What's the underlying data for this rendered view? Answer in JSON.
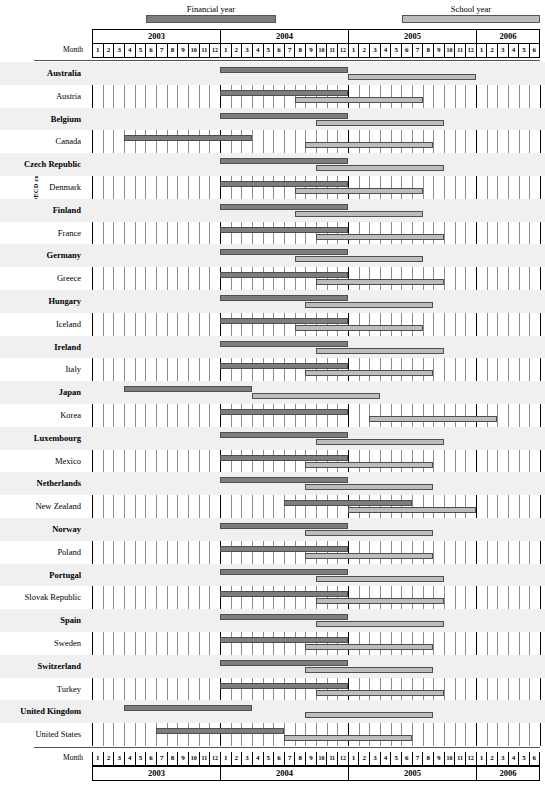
{
  "legend": {
    "financial": {
      "label": "Financial year",
      "color": "#7d7d7d"
    },
    "school": {
      "label": "School year",
      "color": "#bdbdbd"
    }
  },
  "axis": {
    "y_label": "OECD countries",
    "month_label_top": "Month",
    "month_label_bottom": "Month"
  },
  "chart_data": {
    "type": "bar",
    "title": "",
    "xlabel": "Month",
    "ylabel": "OECD countries",
    "orientation": "horizontal-gantt",
    "grid": true,
    "legend_position": "top",
    "x_axis": {
      "years": [
        {
          "year": "2003",
          "months": [
            "1",
            "2",
            "3",
            "4",
            "5",
            "6",
            "7",
            "8",
            "9",
            "10",
            "11",
            "12"
          ]
        },
        {
          "year": "2004",
          "months": [
            "1",
            "2",
            "3",
            "4",
            "5",
            "6",
            "7",
            "8",
            "9",
            "10",
            "11",
            "12"
          ]
        },
        {
          "year": "2005",
          "months": [
            "1",
            "2",
            "3",
            "4",
            "5",
            "6",
            "7",
            "8",
            "9",
            "10",
            "11",
            "12"
          ]
        },
        {
          "year": "2006",
          "months": [
            "1",
            "2",
            "3",
            "4",
            "5",
            "6"
          ]
        }
      ],
      "total_columns": 42,
      "range": [
        "2003-01",
        "2006-06"
      ]
    },
    "series": [
      {
        "name": "Financial year",
        "color": "#7d7d7d"
      },
      {
        "name": "School year",
        "color": "#bdbdbd"
      }
    ],
    "categories": [
      "Australia",
      "Austria",
      "Belgium",
      "Canada",
      "Czech Republic",
      "Denmark",
      "Finland",
      "France",
      "Germany",
      "Greece",
      "Hungary",
      "Iceland",
      "Ireland",
      "Italy",
      "Japan",
      "Korea",
      "Luxembourg",
      "Mexico",
      "Netherlands",
      "New Zealand",
      "Norway",
      "Poland",
      "Portugal",
      "Slovak Republic",
      "Spain",
      "Sweden",
      "Switzerland",
      "Turkey",
      "United Kingdom",
      "United States"
    ],
    "rows": [
      {
        "country": "Australia",
        "financial": [
          13,
          24
        ],
        "school": [
          25,
          36
        ]
      },
      {
        "country": "Austria",
        "financial": [
          13,
          24
        ],
        "school": [
          20,
          31
        ]
      },
      {
        "country": "Belgium",
        "financial": [
          13,
          24
        ],
        "school": [
          22,
          33
        ]
      },
      {
        "country": "Canada",
        "financial": [
          4,
          15
        ],
        "school": [
          21,
          32
        ]
      },
      {
        "country": "Czech Republic",
        "financial": [
          13,
          24
        ],
        "school": [
          22,
          33
        ]
      },
      {
        "country": "Denmark",
        "financial": [
          13,
          24
        ],
        "school": [
          20,
          31
        ]
      },
      {
        "country": "Finland",
        "financial": [
          13,
          24
        ],
        "school": [
          20,
          31
        ]
      },
      {
        "country": "France",
        "financial": [
          13,
          24
        ],
        "school": [
          22,
          33
        ]
      },
      {
        "country": "Germany",
        "financial": [
          13,
          24
        ],
        "school": [
          20,
          31
        ]
      },
      {
        "country": "Greece",
        "financial": [
          13,
          24
        ],
        "school": [
          22,
          33
        ]
      },
      {
        "country": "Hungary",
        "financial": [
          13,
          24
        ],
        "school": [
          21,
          32
        ]
      },
      {
        "country": "Iceland",
        "financial": [
          13,
          24
        ],
        "school": [
          20,
          31
        ]
      },
      {
        "country": "Ireland",
        "financial": [
          13,
          24
        ],
        "school": [
          22,
          33
        ]
      },
      {
        "country": "Italy",
        "financial": [
          13,
          24
        ],
        "school": [
          21,
          32
        ]
      },
      {
        "country": "Japan",
        "financial": [
          4,
          15
        ],
        "school": [
          16,
          27
        ]
      },
      {
        "country": "Korea",
        "financial": [
          13,
          24
        ],
        "school": [
          27,
          38
        ]
      },
      {
        "country": "Luxembourg",
        "financial": [
          13,
          24
        ],
        "school": [
          22,
          33
        ]
      },
      {
        "country": "Mexico",
        "financial": [
          13,
          24
        ],
        "school": [
          21,
          32
        ]
      },
      {
        "country": "Netherlands",
        "financial": [
          13,
          24
        ],
        "school": [
          21,
          32
        ]
      },
      {
        "country": "New Zealand",
        "financial": [
          19,
          30
        ],
        "school": [
          25,
          36
        ]
      },
      {
        "country": "Norway",
        "financial": [
          13,
          24
        ],
        "school": [
          21,
          32
        ]
      },
      {
        "country": "Poland",
        "financial": [
          13,
          24
        ],
        "school": [
          21,
          32
        ]
      },
      {
        "country": "Portugal",
        "financial": [
          13,
          24
        ],
        "school": [
          22,
          33
        ]
      },
      {
        "country": "Slovak Republic",
        "financial": [
          13,
          24
        ],
        "school": [
          22,
          33
        ]
      },
      {
        "country": "Spain",
        "financial": [
          13,
          24
        ],
        "school": [
          22,
          33
        ]
      },
      {
        "country": "Sweden",
        "financial": [
          13,
          24
        ],
        "school": [
          21,
          32
        ]
      },
      {
        "country": "Switzerland",
        "financial": [
          13,
          24
        ],
        "school": [
          21,
          32
        ]
      },
      {
        "country": "Turkey",
        "financial": [
          13,
          24
        ],
        "school": [
          22,
          33
        ]
      },
      {
        "country": "United Kingdom",
        "financial": [
          4,
          15
        ],
        "school": [
          21,
          32
        ]
      },
      {
        "country": "United States",
        "financial": [
          7,
          18
        ],
        "school": [
          19,
          30
        ]
      }
    ]
  }
}
